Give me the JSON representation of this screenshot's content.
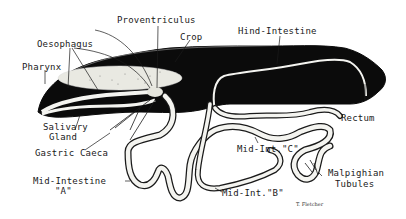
{
  "diagram": {
    "colors": {
      "body_fill": "#0b0b0b",
      "tube_fill": "#f4f4f0",
      "ink": "#1a1a1a",
      "background": "#ffffff"
    },
    "labels": {
      "proventriculus": "Proventriculus",
      "crop": "Crop",
      "oesophagus": "Oesophagus",
      "pharynx": "Pharynx",
      "hind_intestine": "Hind-Intestine",
      "salivary_gland_line1": "Salivary",
      "salivary_gland_line2": "Gland",
      "gastric_caeca": "Gastric Caeca",
      "rectum": "Rectum",
      "mid_int_c": "Mid-Int.\"C\"",
      "malpighian_line1": "Malpighian",
      "malpighian_line2": "Tubules",
      "mid_intestine_a_line1": "Mid-Intestine",
      "mid_intestine_a_line2": "\"A\"",
      "mid_int_b": "Mid-Int.\"B\""
    },
    "signature": "T. Fletcher"
  }
}
